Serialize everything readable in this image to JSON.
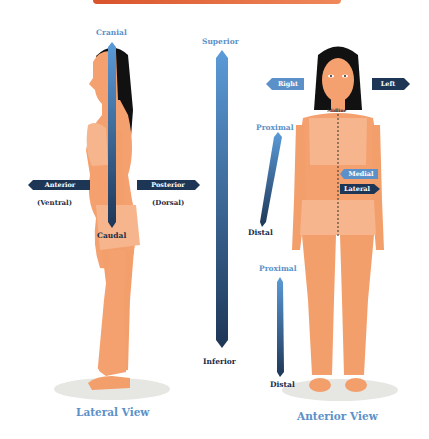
{
  "header": {
    "bar_color": "#e56a3d"
  },
  "lateral_view": {
    "title": "Lateral View",
    "cranial": "Cranial",
    "caudal": "Caudal",
    "anterior": "Anterior",
    "ventral": "(Ventral)",
    "posterior": "Posterior",
    "dorsal": "(Dorsal)"
  },
  "center_axis": {
    "superior": "Superior",
    "inferior": "Inferior"
  },
  "anterior_view": {
    "title": "Anterior View",
    "right": "Right",
    "left": "Left",
    "midline": "Midline",
    "medial": "Medial",
    "lateral": "Lateral",
    "arm_proximal": "Proximal",
    "arm_distal": "Distal",
    "leg_proximal": "Proximal",
    "leg_distal": "Distal"
  },
  "colors": {
    "light_blue": "#5b91c8",
    "dark_navy": "#1b2d46",
    "skin": "#f4a06f",
    "skin_light": "#f6b58c",
    "hair": "#111111"
  }
}
